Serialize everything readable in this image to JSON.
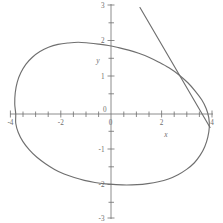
{
  "figure": {
    "title": "",
    "background_color": "#ffffff",
    "curve_color": "#6f6f6f",
    "axis_color": "#6e6e6e",
    "label_color": "#6e6e6e"
  },
  "axes": {
    "x_label": "x",
    "y_label": "y",
    "x_ticks_labeled": [
      "-4",
      "-2",
      "2",
      "4"
    ],
    "y_ticks_labeled": [
      "3",
      "2",
      "1",
      "-1",
      "-2",
      "-3"
    ],
    "origin_label": "0",
    "origin_label_below": "0"
  },
  "chart_data": {
    "type": "line",
    "title": "",
    "xlabel": "x",
    "ylabel": "y",
    "xlim": [
      -4,
      4
    ],
    "ylim": [
      -3,
      3
    ],
    "xticks": [
      -4,
      -3.5,
      -3,
      -2.5,
      -2,
      -1.5,
      -1,
      -0.5,
      0,
      0.5,
      1,
      1.5,
      2,
      2.5,
      3,
      3.5,
      4
    ],
    "xtick_labels": [
      "-4",
      "",
      "-2",
      "",
      "0",
      "",
      "2",
      "",
      "4"
    ],
    "xticks_labeled": [
      -4,
      -2,
      0,
      2,
      4
    ],
    "yticks": [
      -3,
      -2.5,
      -2,
      -1.5,
      -1,
      -0.5,
      0,
      0.5,
      1,
      1.5,
      2,
      2.5,
      3
    ],
    "yticks_labeled": [
      -3,
      -2,
      -1,
      0,
      1,
      2,
      3
    ],
    "grid": false,
    "legend": null,
    "series": [
      {
        "name": "implicit-closed-curve",
        "type": "closed-curve",
        "color": "#6f6f6f",
        "points": [
          [
            -3.78,
            0.0
          ],
          [
            -3.82,
            0.28
          ],
          [
            -3.8,
            0.6
          ],
          [
            -3.72,
            0.9
          ],
          [
            -3.58,
            1.16
          ],
          [
            -3.38,
            1.4
          ],
          [
            -3.12,
            1.6
          ],
          [
            -2.82,
            1.76
          ],
          [
            -2.48,
            1.88
          ],
          [
            -2.1,
            1.96
          ],
          [
            -1.7,
            2.0
          ],
          [
            -1.3,
            2.02
          ],
          [
            -0.9,
            2.0
          ],
          [
            -0.5,
            1.97
          ],
          [
            -0.1,
            1.93
          ],
          [
            0.3,
            1.87
          ],
          [
            0.7,
            1.8
          ],
          [
            1.1,
            1.71
          ],
          [
            1.5,
            1.6
          ],
          [
            1.9,
            1.46
          ],
          [
            2.3,
            1.3
          ],
          [
            2.7,
            1.1
          ],
          [
            3.05,
            0.88
          ],
          [
            3.35,
            0.64
          ],
          [
            3.6,
            0.4
          ],
          [
            3.78,
            0.15
          ],
          [
            3.88,
            -0.1
          ],
          [
            3.9,
            -0.38
          ],
          [
            3.84,
            -0.66
          ],
          [
            3.72,
            -0.92
          ],
          [
            3.54,
            -1.16
          ],
          [
            3.3,
            -1.38
          ],
          [
            3.0,
            -1.56
          ],
          [
            2.66,
            -1.71
          ],
          [
            2.28,
            -1.83
          ],
          [
            1.88,
            -1.91
          ],
          [
            1.46,
            -1.96
          ],
          [
            1.04,
            -1.99
          ],
          [
            0.62,
            -2.0
          ],
          [
            0.2,
            -1.99
          ],
          [
            -0.22,
            -1.97
          ],
          [
            -0.64,
            -1.93
          ],
          [
            -1.06,
            -1.87
          ],
          [
            -1.46,
            -1.79
          ],
          [
            -1.86,
            -1.69
          ],
          [
            -2.24,
            -1.56
          ],
          [
            -2.6,
            -1.4
          ],
          [
            -2.94,
            -1.22
          ],
          [
            -3.24,
            -1.01
          ],
          [
            -3.5,
            -0.77
          ],
          [
            -3.68,
            -0.52
          ],
          [
            -3.78,
            -0.26
          ],
          [
            -3.78,
            0.0
          ]
        ]
      },
      {
        "name": "tangent-line",
        "type": "line",
        "color": "#6f6f6f",
        "points": [
          [
            1.15,
            3.0
          ],
          [
            3.93,
            -0.38
          ]
        ]
      }
    ]
  }
}
